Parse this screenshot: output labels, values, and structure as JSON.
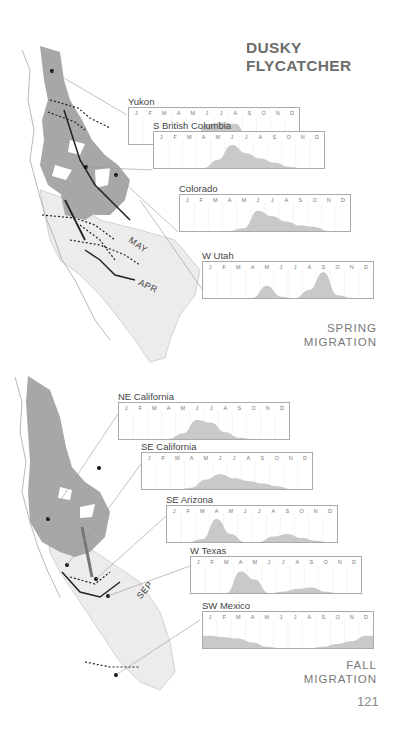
{
  "page": {
    "title": "DUSKY FLYCATCHER",
    "page_number": "121",
    "spring_label_line1": "SPRING",
    "spring_label_line2": "MIGRATION",
    "fall_label_line1": "FALL",
    "fall_label_line2": "MIGRATION",
    "map_labels": {
      "may": "MAY",
      "apr": "APR",
      "sep": "SEP"
    }
  },
  "chart_data": [
    {
      "type": "area",
      "section": "spring",
      "title": "Yukon",
      "categories": [
        "J",
        "F",
        "M",
        "A",
        "M",
        "J",
        "J",
        "A",
        "S",
        "O",
        "N",
        "D"
      ],
      "values": [
        0,
        0,
        0,
        0,
        0.05,
        0.75,
        0.8,
        0.75,
        0.1,
        0,
        0,
        0
      ],
      "ylim": [
        0,
        1
      ],
      "grid": true
    },
    {
      "type": "area",
      "section": "spring",
      "title": "S British Columbia",
      "categories": [
        "J",
        "F",
        "M",
        "A",
        "M",
        "J",
        "J",
        "A",
        "S",
        "O",
        "N",
        "D"
      ],
      "values": [
        0,
        0,
        0,
        0,
        0.3,
        0.85,
        0.55,
        0.35,
        0.2,
        0.05,
        0,
        0
      ],
      "ylim": [
        0,
        1
      ],
      "grid": true
    },
    {
      "type": "area",
      "section": "spring",
      "title": "Colorado",
      "categories": [
        "J",
        "F",
        "M",
        "A",
        "M",
        "J",
        "J",
        "A",
        "S",
        "O",
        "N",
        "D"
      ],
      "values": [
        0,
        0,
        0,
        0,
        0.1,
        0.75,
        0.55,
        0.35,
        0.2,
        0.15,
        0,
        0
      ],
      "ylim": [
        0,
        1
      ],
      "grid": true
    },
    {
      "type": "area",
      "section": "spring",
      "title": "W Utah",
      "categories": [
        "J",
        "F",
        "M",
        "A",
        "M",
        "J",
        "J",
        "A",
        "S",
        "O",
        "N",
        "D"
      ],
      "values": [
        0,
        0,
        0,
        0,
        0.45,
        0.05,
        0,
        0.3,
        0.95,
        0.1,
        0,
        0
      ],
      "ylim": [
        0,
        1
      ],
      "grid": true
    },
    {
      "type": "area",
      "section": "fall",
      "title": "NE California",
      "categories": [
        "J",
        "F",
        "M",
        "A",
        "M",
        "J",
        "J",
        "A",
        "S",
        "O",
        "N",
        "D"
      ],
      "values": [
        0,
        0,
        0,
        0,
        0.2,
        0.7,
        0.6,
        0.25,
        0.05,
        0,
        0,
        0
      ],
      "ylim": [
        0,
        1
      ],
      "grid": true
    },
    {
      "type": "area",
      "section": "fall",
      "title": "SE California",
      "categories": [
        "J",
        "F",
        "M",
        "A",
        "M",
        "J",
        "J",
        "A",
        "S",
        "O",
        "N",
        "D"
      ],
      "values": [
        0,
        0,
        0,
        0.05,
        0.35,
        0.55,
        0.4,
        0.3,
        0.2,
        0.1,
        0,
        0
      ],
      "ylim": [
        0,
        1
      ],
      "grid": true
    },
    {
      "type": "area",
      "section": "fall",
      "title": "SE Arizona",
      "categories": [
        "J",
        "F",
        "M",
        "A",
        "M",
        "J",
        "J",
        "A",
        "S",
        "O",
        "N",
        "D"
      ],
      "values": [
        0,
        0,
        0.1,
        0.85,
        0.3,
        0,
        0,
        0.2,
        0.3,
        0.15,
        0.05,
        0
      ],
      "ylim": [
        0,
        1
      ],
      "grid": true
    },
    {
      "type": "area",
      "section": "fall",
      "title": "W Texas",
      "categories": [
        "J",
        "F",
        "M",
        "A",
        "M",
        "J",
        "J",
        "A",
        "S",
        "O",
        "N",
        "D"
      ],
      "values": [
        0,
        0,
        0,
        0.8,
        0.5,
        0,
        0.05,
        0.15,
        0.2,
        0.05,
        0,
        0
      ],
      "ylim": [
        0,
        1
      ],
      "grid": true
    },
    {
      "type": "area",
      "section": "fall",
      "title": "SW Mexico",
      "categories": [
        "J",
        "F",
        "M",
        "A",
        "M",
        "J",
        "J",
        "A",
        "S",
        "O",
        "N",
        "D"
      ],
      "values": [
        0.45,
        0.4,
        0.35,
        0.2,
        0.05,
        0,
        0,
        0,
        0.05,
        0.15,
        0.25,
        0.45
      ],
      "ylim": [
        0,
        1
      ],
      "grid": true
    }
  ]
}
